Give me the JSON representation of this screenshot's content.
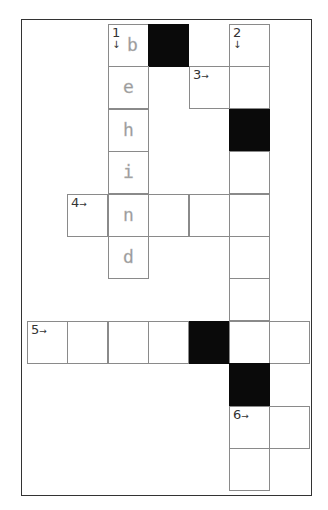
{
  "puzzle": {
    "type": "crossword",
    "grid": {
      "cols": 7,
      "rows": 11,
      "origin_x": 27,
      "origin_y": 24,
      "cell_w": 40.4,
      "cell_h": 42.4
    },
    "colors": {
      "black": "#0a0a0a",
      "border": "#8a8a8a",
      "letter": "#999999"
    },
    "cells": [
      {
        "r": 0,
        "c": 2,
        "num": "1",
        "dir": "down",
        "letter": "b"
      },
      {
        "r": 0,
        "c": 3,
        "black": true
      },
      {
        "r": 0,
        "c": 5,
        "num": "2",
        "dir": "down"
      },
      {
        "r": 1,
        "c": 2,
        "letter": "e"
      },
      {
        "r": 1,
        "c": 4,
        "num": "3",
        "dir": "across"
      },
      {
        "r": 1,
        "c": 5
      },
      {
        "r": 2,
        "c": 2,
        "letter": "h"
      },
      {
        "r": 2,
        "c": 5,
        "black": true
      },
      {
        "r": 3,
        "c": 2,
        "letter": "i"
      },
      {
        "r": 3,
        "c": 5
      },
      {
        "r": 4,
        "c": 1,
        "num": "4",
        "dir": "across"
      },
      {
        "r": 4,
        "c": 2,
        "letter": "n"
      },
      {
        "r": 4,
        "c": 3
      },
      {
        "r": 4,
        "c": 4
      },
      {
        "r": 4,
        "c": 5
      },
      {
        "r": 5,
        "c": 2,
        "letter": "d"
      },
      {
        "r": 5,
        "c": 5
      },
      {
        "r": 6,
        "c": 5
      },
      {
        "r": 7,
        "c": 0,
        "num": "5",
        "dir": "across"
      },
      {
        "r": 7,
        "c": 1
      },
      {
        "r": 7,
        "c": 2
      },
      {
        "r": 7,
        "c": 3
      },
      {
        "r": 7,
        "c": 4,
        "black": true
      },
      {
        "r": 7,
        "c": 5
      },
      {
        "r": 7,
        "c": 6
      },
      {
        "r": 8,
        "c": 5,
        "black": true
      },
      {
        "r": 9,
        "c": 5,
        "num": "6",
        "dir": "across"
      },
      {
        "r": 9,
        "c": 6
      },
      {
        "r": 10,
        "c": 5
      }
    ],
    "filled_word_1_down": "behind",
    "arrows": {
      "down": "↓",
      "across": "→"
    }
  }
}
